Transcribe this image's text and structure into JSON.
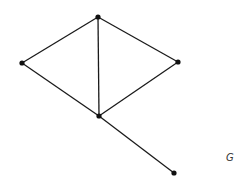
{
  "graph": {
    "label": "G",
    "nodes": [
      {
        "id": "top",
        "x": 98,
        "y": 17
      },
      {
        "id": "left",
        "x": 22,
        "y": 63
      },
      {
        "id": "right",
        "x": 178,
        "y": 62
      },
      {
        "id": "middle",
        "x": 99,
        "y": 116
      },
      {
        "id": "bottom",
        "x": 174,
        "y": 173
      }
    ],
    "edges": [
      [
        "top",
        "left"
      ],
      [
        "top",
        "right"
      ],
      [
        "top",
        "middle"
      ],
      [
        "left",
        "middle"
      ],
      [
        "right",
        "middle"
      ],
      [
        "middle",
        "bottom"
      ]
    ],
    "colors": {
      "edge": "#1a1a1a",
      "node": "#111111",
      "label": "#333333"
    }
  }
}
